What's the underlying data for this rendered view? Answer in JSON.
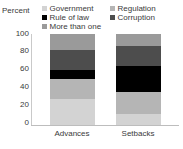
{
  "chart_data": {
    "type": "bar",
    "subtype": "stacked-vertical-100",
    "title": "",
    "xlabel": "",
    "ylabel": "Percent",
    "ylim": [
      0,
      100
    ],
    "yticks": [
      0,
      20,
      40,
      60,
      80,
      100
    ],
    "ytick_labels": [
      "0",
      "20",
      "40",
      "60",
      "80",
      "100"
    ],
    "grid": false,
    "legend_position": "top",
    "categories": [
      "Advances",
      "Setbacks"
    ],
    "series": [
      {
        "name": "Government",
        "color": "#d3d3d3",
        "values": [
          10,
          12
        ]
      },
      {
        "name": "Regulation",
        "color": "#b5b5b5",
        "values": [
          22,
          24
        ]
      },
      {
        "name": "Rule of law",
        "color": "#000000",
        "values": [
          9,
          29
        ]
      },
      {
        "name": "Corruption",
        "color": "#4d4d4d",
        "values": [
          22,
          22
        ]
      },
      {
        "name": "More than one",
        "color": "#9a9a9a",
        "values": [
          37,
          13
        ]
      }
    ]
  },
  "axis": {
    "y_title": "Percent",
    "tick_labels": [
      "100",
      "80",
      "60",
      "40",
      "20",
      "0"
    ]
  },
  "legend": {
    "items": [
      {
        "label": "Government",
        "color": "#d3d3d3"
      },
      {
        "label": "Rule of law",
        "color": "#000000"
      },
      {
        "label": "More than one",
        "color": "#9a9a9a"
      },
      {
        "label": "Regulation",
        "color": "#b5b5b5"
      },
      {
        "label": "Corruption",
        "color": "#4d4d4d"
      }
    ]
  },
  "categories": [
    "Advances",
    "Setbacks"
  ],
  "bars": {
    "advances": [
      {
        "series": "More than one",
        "color": "#9a9a9a",
        "percent": 18
      },
      {
        "series": "Corruption",
        "color": "#4d4d4d",
        "percent": 22
      },
      {
        "series": "Rule of law",
        "color": "#000000",
        "percent": 9
      },
      {
        "series": "Regulation",
        "color": "#b5b5b5",
        "percent": 22
      },
      {
        "series": "Government",
        "color": "#d3d3d3",
        "percent": 29
      }
    ],
    "setbacks": [
      {
        "series": "More than one",
        "color": "#9a9a9a",
        "percent": 13
      },
      {
        "series": "Corruption",
        "color": "#4d4d4d",
        "percent": 22
      },
      {
        "series": "Rule of law",
        "color": "#000000",
        "percent": 29
      },
      {
        "series": "Regulation",
        "color": "#b5b5b5",
        "percent": 24
      },
      {
        "series": "Government",
        "color": "#d3d3d3",
        "percent": 12
      }
    ]
  },
  "colors": {
    "government": "#d3d3d3",
    "regulation": "#b5b5b5",
    "rule_of_law": "#000000",
    "corruption": "#4d4d4d",
    "more_than_one": "#9a9a9a",
    "text": "#3a3a3a",
    "axis": "#bdbdbd",
    "background": "#ffffff"
  }
}
